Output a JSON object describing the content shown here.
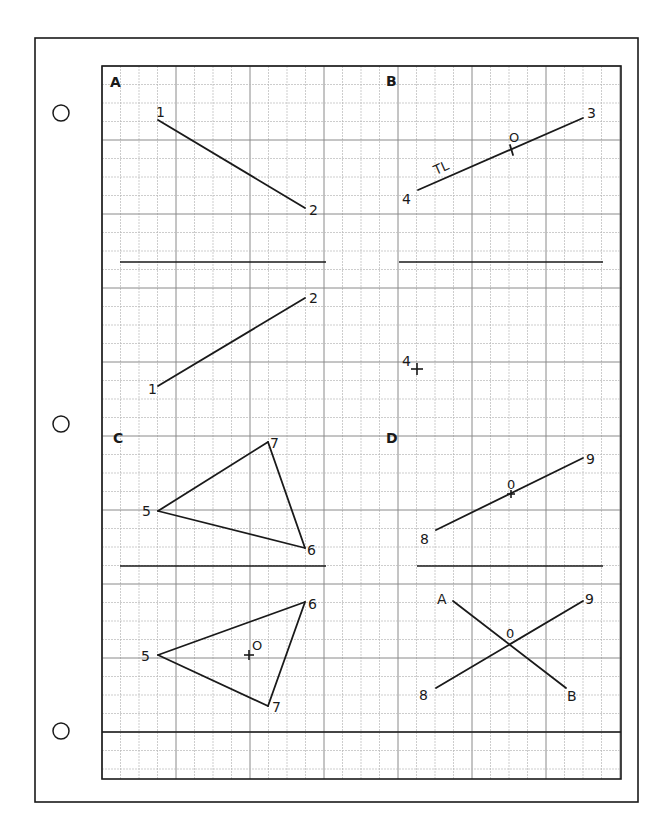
{
  "page": {
    "background": "#ffffff",
    "ink": "#1a1a1a",
    "grid_minor_color": "#b8b8b8",
    "grid_major_color": "#8a8a8a"
  },
  "sheet_frame": {
    "x": 35,
    "y": 38,
    "w": 273,
    "h": 0,
    "x2": 638,
    "y2": 802
  },
  "binder_holes": [
    {
      "cx": 61,
      "cy": 113,
      "r": 8
    },
    {
      "cx": 61,
      "cy": 424,
      "r": 8
    },
    {
      "cx": 61,
      "cy": 731,
      "r": 8
    }
  ],
  "grid": {
    "x0": 102,
    "y0": 66,
    "x1": 621,
    "y1": 779,
    "cell": 18.5,
    "major_every": 4
  },
  "dividers": [
    {
      "x1": 120,
      "y1": 262,
      "x2": 326,
      "y2": 262
    },
    {
      "x1": 399,
      "y1": 262,
      "x2": 603,
      "y2": 262
    },
    {
      "x1": 120,
      "y1": 566,
      "x2": 326,
      "y2": 566
    },
    {
      "x1": 417,
      "y1": 566,
      "x2": 603,
      "y2": 566
    },
    {
      "x1": 102,
      "y1": 732,
      "x2": 621,
      "y2": 732
    }
  ],
  "panels": [
    {
      "id": "A",
      "label": "A",
      "x": 110,
      "y": 87
    },
    {
      "id": "B",
      "label": "B",
      "x": 386,
      "y": 86
    },
    {
      "id": "C",
      "label": "C",
      "x": 113,
      "y": 443
    },
    {
      "id": "D",
      "label": "D",
      "x": 386,
      "y": 443
    }
  ],
  "segments": [
    {
      "name": "a-top-1-2",
      "x1": 158,
      "y1": 120,
      "x2": 305,
      "y2": 208
    },
    {
      "name": "a-bottom-1-2",
      "x1": 158,
      "y1": 386,
      "x2": 305,
      "y2": 298
    },
    {
      "name": "b-top-4-3",
      "x1": 418,
      "y1": 190,
      "x2": 583,
      "y2": 118
    },
    {
      "name": "b-tick-o",
      "x1": 510,
      "y1": 145,
      "x2": 513,
      "y2": 155
    },
    {
      "name": "c-top-5-7",
      "x1": 158,
      "y1": 511,
      "x2": 268,
      "y2": 442
    },
    {
      "name": "c-top-7-6",
      "x1": 268,
      "y1": 442,
      "x2": 305,
      "y2": 548
    },
    {
      "name": "c-top-6-5",
      "x1": 305,
      "y1": 548,
      "x2": 158,
      "y2": 511
    },
    {
      "name": "d-top-8-9",
      "x1": 436,
      "y1": 530,
      "x2": 583,
      "y2": 458
    },
    {
      "name": "c-bottom-5-6",
      "x1": 158,
      "y1": 655,
      "x2": 305,
      "y2": 602
    },
    {
      "name": "c-bottom-6-7",
      "x1": 305,
      "y1": 602,
      "x2": 268,
      "y2": 706
    },
    {
      "name": "c-bottom-7-5",
      "x1": 268,
      "y1": 706,
      "x2": 158,
      "y2": 655
    },
    {
      "name": "d-bottom-a-b",
      "x1": 453,
      "y1": 601,
      "x2": 566,
      "y2": 688
    },
    {
      "name": "d-bottom-8-9",
      "x1": 436,
      "y1": 688,
      "x2": 583,
      "y2": 601
    }
  ],
  "crosses": [
    {
      "name": "b-point-4-cross",
      "x": 417,
      "y": 369,
      "s": 6
    },
    {
      "name": "d-top-o-tick",
      "x": 511,
      "y": 494,
      "s": 4
    },
    {
      "name": "c-bottom-o-cross",
      "x": 249,
      "y": 655,
      "s": 5
    }
  ],
  "labels": [
    {
      "name": "a-top-label-1",
      "text": "1",
      "x": 156,
      "y": 117,
      "size": 14
    },
    {
      "name": "a-top-label-2",
      "text": "2",
      "x": 309,
      "y": 215,
      "size": 14
    },
    {
      "name": "a-bottom-label-2",
      "text": "2",
      "x": 309,
      "y": 303,
      "size": 14
    },
    {
      "name": "a-bottom-label-1",
      "text": "1",
      "x": 148,
      "y": 394,
      "size": 14
    },
    {
      "name": "b-top-label-3",
      "text": "3",
      "x": 587,
      "y": 118,
      "size": 14
    },
    {
      "name": "b-top-label-o",
      "text": "O",
      "x": 509,
      "y": 142,
      "size": 13
    },
    {
      "name": "b-top-label-tl",
      "text": "TL",
      "x": 436,
      "y": 175,
      "size": 13,
      "rotate": -24
    },
    {
      "name": "b-top-label-4",
      "text": "4",
      "x": 402,
      "y": 204,
      "size": 14
    },
    {
      "name": "b-bottom-label-4",
      "text": "4",
      "x": 402,
      "y": 366,
      "size": 14
    },
    {
      "name": "c-top-label-7",
      "text": "7",
      "x": 270,
      "y": 448,
      "size": 14
    },
    {
      "name": "c-top-label-5",
      "text": "5",
      "x": 142,
      "y": 516,
      "size": 14
    },
    {
      "name": "c-top-label-6",
      "text": "6",
      "x": 307,
      "y": 555,
      "size": 14
    },
    {
      "name": "d-top-label-9",
      "text": "9",
      "x": 586,
      "y": 464,
      "size": 14
    },
    {
      "name": "d-top-label-o",
      "text": "0",
      "x": 507,
      "y": 489,
      "size": 13
    },
    {
      "name": "d-top-label-8",
      "text": "8",
      "x": 420,
      "y": 544,
      "size": 14
    },
    {
      "name": "c-bottom-label-6",
      "text": "6",
      "x": 308,
      "y": 609,
      "size": 14
    },
    {
      "name": "c-bottom-label-5",
      "text": "5",
      "x": 141,
      "y": 661,
      "size": 14
    },
    {
      "name": "c-bottom-label-o",
      "text": "O",
      "x": 252,
      "y": 650,
      "size": 13
    },
    {
      "name": "c-bottom-label-7",
      "text": "7",
      "x": 272,
      "y": 712,
      "size": 14
    },
    {
      "name": "d-bottom-label-a",
      "text": "A",
      "x": 437,
      "y": 604,
      "size": 14
    },
    {
      "name": "d-bottom-label-9",
      "text": "9",
      "x": 585,
      "y": 604,
      "size": 14
    },
    {
      "name": "d-bottom-label-o",
      "text": "0",
      "x": 506,
      "y": 638,
      "size": 13
    },
    {
      "name": "d-bottom-label-8",
      "text": "8",
      "x": 419,
      "y": 700,
      "size": 14
    },
    {
      "name": "d-bottom-label-b",
      "text": "B",
      "x": 567,
      "y": 701,
      "size": 14
    }
  ]
}
